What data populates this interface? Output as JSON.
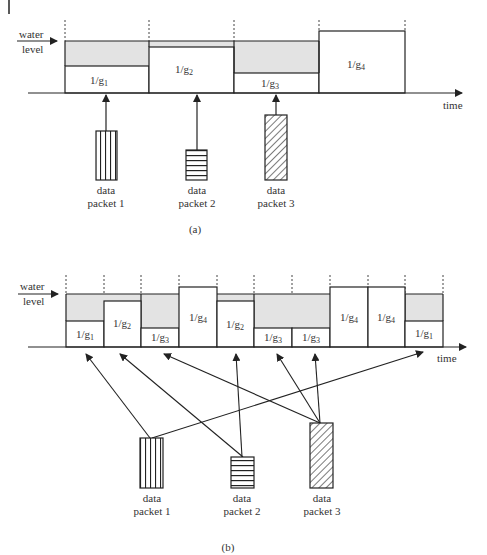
{
  "page": {
    "edge_marker": "|"
  },
  "diagram_a": {
    "caption": "(a)",
    "y_label_line1": "water",
    "y_label_line2": "level",
    "x_label": "time",
    "slots": [
      {
        "num": "1/g",
        "sub": "1",
        "label": "1/g1"
      },
      {
        "num": "1/g",
        "sub": "2",
        "label": "1/g2"
      },
      {
        "num": "1/g",
        "sub": "3",
        "label": "1/g3"
      },
      {
        "num": "1/g",
        "sub": "4",
        "label": "1/g4"
      }
    ],
    "packets": [
      {
        "line1": "data",
        "line2": "packet 1",
        "pattern": "vertical-stripes"
      },
      {
        "line1": "data",
        "line2": "packet 2",
        "pattern": "horizontal-stripes"
      },
      {
        "line1": "data",
        "line2": "packet 3",
        "pattern": "diagonal-hatch"
      }
    ]
  },
  "diagram_b": {
    "caption": "(b)",
    "y_label_line1": "water",
    "y_label_line2": "level",
    "x_label": "time",
    "slots": [
      {
        "num": "1/g",
        "sub": "1"
      },
      {
        "num": "1/g",
        "sub": "2"
      },
      {
        "num": "1/g",
        "sub": "3"
      },
      {
        "num": "1/g",
        "sub": "4"
      },
      {
        "num": "1/g",
        "sub": "2"
      },
      {
        "num": "1/g",
        "sub": "3"
      },
      {
        "num": "1/g",
        "sub": "3"
      },
      {
        "num": "1/g",
        "sub": "4"
      },
      {
        "num": "1/g",
        "sub": "4"
      },
      {
        "num": "1/g",
        "sub": "1"
      }
    ],
    "packets": [
      {
        "line1": "data",
        "line2": "packet 1",
        "pattern": "vertical-stripes",
        "assigned_slots": [
          1,
          10
        ]
      },
      {
        "line1": "data",
        "line2": "packet 2",
        "pattern": "horizontal-stripes",
        "assigned_slots": [
          2,
          5
        ]
      },
      {
        "line1": "data",
        "line2": "packet 3",
        "pattern": "diagonal-hatch",
        "assigned_slots": [
          3,
          6,
          7
        ]
      }
    ]
  },
  "colors": {
    "fill_gray": "#e3e3e3",
    "line": "#222222"
  }
}
